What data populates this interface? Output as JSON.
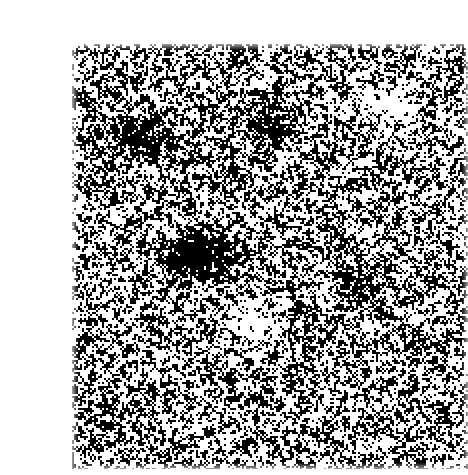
{
  "page": {
    "width": 449,
    "height": 475,
    "background_color": "#ffffff"
  },
  "figure": {
    "name": "binary-noise-texture",
    "kind": "bitmap-noise",
    "caption": "",
    "region": {
      "x": 32,
      "y": 28,
      "width": 396,
      "height": 425
    },
    "appearance": {
      "foreground_color": "#000000",
      "background_color": "#ffffff",
      "block_size_px": 2,
      "black_fill_ratio": 0.47,
      "edge_softness_px": 1,
      "description": "dithered one-bit random speckle"
    },
    "clusters": [
      {
        "name": "dark-cluster-left-center",
        "x": 140,
        "y": 225,
        "width": 42,
        "height": 26,
        "density": 0.88
      },
      {
        "name": "dark-cluster-upper-left",
        "x": 92,
        "y": 112,
        "width": 34,
        "height": 22,
        "density": 0.72
      },
      {
        "name": "dark-cluster-upper-mid",
        "x": 214,
        "y": 96,
        "width": 30,
        "height": 24,
        "density": 0.7
      },
      {
        "name": "dark-cluster-mid-right",
        "x": 300,
        "y": 258,
        "width": 32,
        "height": 22,
        "density": 0.68
      },
      {
        "name": "light-patch-upper-right",
        "x": 330,
        "y": 78,
        "width": 34,
        "height": 26,
        "density": 0.18
      },
      {
        "name": "light-patch-center",
        "x": 196,
        "y": 292,
        "width": 30,
        "height": 24,
        "density": 0.2
      }
    ]
  }
}
